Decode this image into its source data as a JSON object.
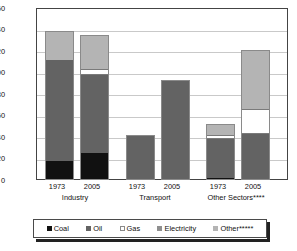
{
  "chart_data": {
    "type": "bar",
    "title": "",
    "subtitle": "",
    "xlabel": "",
    "ylabel": "Mtoe",
    "ylim": [
      0,
      160
    ],
    "ytick_step": 20,
    "yticks": [
      "160",
      "140",
      "120",
      "100",
      "80",
      "60",
      "40",
      "20",
      "0"
    ],
    "grid": true,
    "stacked": true,
    "legend_position": "bottom",
    "groups": [
      {
        "name": "Industry",
        "label": "Industry",
        "bars": [
          {
            "x": "1973",
            "total": 139,
            "segments": [
              {
                "series": "Coal",
                "value": 18
              },
              {
                "series": "Oil",
                "value": 94
              },
              {
                "series": "Gas",
                "value": 0
              },
              {
                "series": "Electricity",
                "value": 0
              },
              {
                "series": "Other*****",
                "value": 27
              }
            ]
          },
          {
            "x": "2005",
            "total": 135,
            "segments": [
              {
                "series": "Coal",
                "value": 25
              },
              {
                "series": "Oil",
                "value": 73
              },
              {
                "series": "Gas",
                "value": 5
              },
              {
                "series": "Electricity",
                "value": 0
              },
              {
                "series": "Other*****",
                "value": 32
              }
            ]
          }
        ]
      },
      {
        "name": "Transport",
        "label": "Transport",
        "bars": [
          {
            "x": "1973",
            "total": 42,
            "segments": [
              {
                "series": "Coal",
                "value": 0
              },
              {
                "series": "Oil",
                "value": 42
              },
              {
                "series": "Gas",
                "value": 0
              },
              {
                "series": "Electricity",
                "value": 0
              },
              {
                "series": "Other*****",
                "value": 0
              }
            ]
          },
          {
            "x": "2005",
            "total": 93,
            "segments": [
              {
                "series": "Coal",
                "value": 0
              },
              {
                "series": "Oil",
                "value": 93
              },
              {
                "series": "Gas",
                "value": 0
              },
              {
                "series": "Electricity",
                "value": 0
              },
              {
                "series": "Other*****",
                "value": 0
              }
            ]
          }
        ]
      },
      {
        "name": "Other Sectors",
        "label": "Other Sectors****",
        "bars": [
          {
            "x": "1973",
            "total": 52,
            "segments": [
              {
                "series": "Coal",
                "value": 1.5
              },
              {
                "series": "Oil",
                "value": 36.5
              },
              {
                "series": "Gas",
                "value": 4
              },
              {
                "series": "Electricity",
                "value": 0
              },
              {
                "series": "Other*****",
                "value": 10
              }
            ]
          },
          {
            "x": "2005",
            "total": 121,
            "segments": [
              {
                "series": "Coal",
                "value": 0
              },
              {
                "series": "Oil",
                "value": 43
              },
              {
                "series": "Gas",
                "value": 23
              },
              {
                "series": "Electricity",
                "value": 0
              },
              {
                "series": "Other*****",
                "value": 55
              }
            ]
          }
        ]
      }
    ],
    "series": [
      {
        "name": "Coal",
        "color": "#111111"
      },
      {
        "name": "Oil",
        "color": "#636363"
      },
      {
        "name": "Gas",
        "color": "#ffffff"
      },
      {
        "name": "Electricity",
        "color": "#8f8f8f"
      },
      {
        "name": "Other*****",
        "color": "#b4b4b4"
      }
    ],
    "legend": [
      {
        "label": "Coal",
        "key": "coal"
      },
      {
        "label": "Oil",
        "key": "oil"
      },
      {
        "label": "Gas",
        "key": "gas"
      },
      {
        "label": "Electricity",
        "key": "electricity"
      },
      {
        "label": "Other*****",
        "key": "other"
      }
    ]
  }
}
